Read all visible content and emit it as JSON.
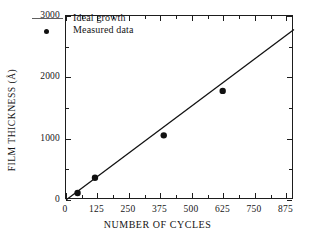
{
  "chart_data": {
    "type": "scatter",
    "title": "",
    "xlabel": "NUMBER OF CYCLES",
    "ylabel": "FILM THICKNESS (Å)",
    "xlim": [
      0,
      905
    ],
    "ylim": [
      0,
      3000
    ],
    "xticks": [
      0,
      125,
      250,
      375,
      500,
      625,
      750,
      875
    ],
    "xticklabels": [
      "0",
      "125",
      "250",
      "375",
      "500",
      "625",
      "750",
      "875"
    ],
    "yticks": [
      0,
      1000,
      2000,
      3000
    ],
    "yticklabels": [
      "0",
      "1000",
      "2000",
      "3000"
    ],
    "x_minor_ticks": [
      62.5,
      187.5,
      312.5,
      437.5,
      562.5,
      687.5,
      812.5
    ],
    "y_minor_ticks": [
      500,
      1500,
      2500
    ],
    "grid": false,
    "legend_position": "upper left",
    "series": [
      {
        "name": "Ideal growth",
        "type": "line",
        "marker": "none",
        "color": "#121212",
        "x": [
          0,
          905
        ],
        "y": [
          0,
          2780
        ]
      },
      {
        "name": "Measured data",
        "type": "scatter",
        "marker": "circle",
        "color": "#111111",
        "x": [
          46,
          115,
          388,
          622
        ],
        "y": [
          115,
          362,
          1054,
          1779
        ]
      }
    ]
  },
  "legend": {
    "entries": [
      {
        "label": "Ideal growth",
        "key": "line"
      },
      {
        "label": "Measured data",
        "key": "dot"
      }
    ]
  },
  "axes": {
    "x_title": "NUMBER OF CYCLES",
    "y_title": "FILM THICKNESS (Å)"
  }
}
